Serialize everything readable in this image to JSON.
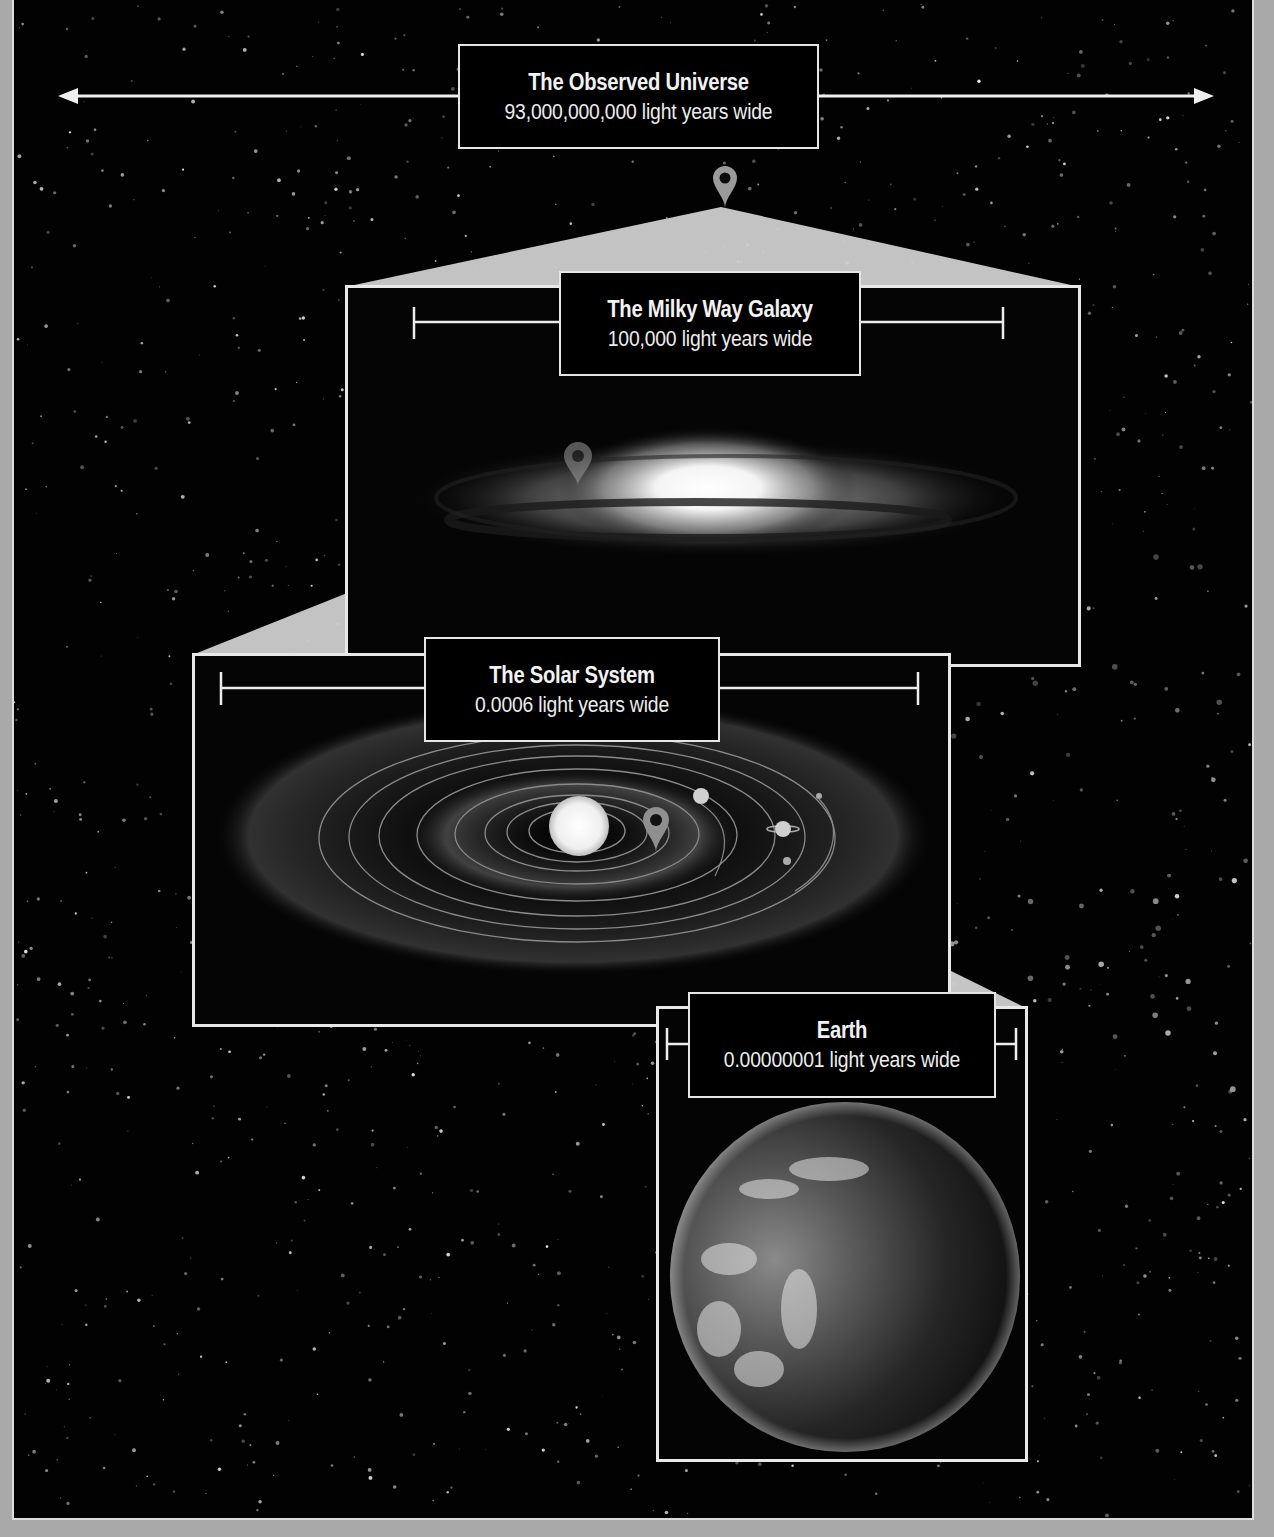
{
  "diagram": {
    "type": "scale-zoom-infographic",
    "theme": "grayscale",
    "colors": {
      "background": "#020202",
      "outer_frame": "#a9a9a9",
      "line": "#e8e8e8",
      "zoom_wedge": "#cfcfcf",
      "label_box_bg": "#000000",
      "label_text": "#f2f2f2",
      "pin": "#9a9a9a"
    },
    "levels": [
      {
        "id": "universe",
        "title": "The Observed Universe",
        "subtitle": "93,000,000,000 light years wide",
        "indicator": "double-arrow-span"
      },
      {
        "id": "galaxy",
        "title": "The Milky Way Galaxy",
        "subtitle": "100,000 light years wide",
        "indicator": "bracket-span",
        "image": "spiral-galaxy-edge-on"
      },
      {
        "id": "solar-system",
        "title": "The Solar System",
        "subtitle": "0.0006 light years wide",
        "indicator": "bracket-span",
        "image": "sun-with-orbits"
      },
      {
        "id": "earth",
        "title": "Earth",
        "subtitle": "0.00000001 light years wide",
        "indicator": "bracket-span",
        "image": "earth-globe"
      }
    ],
    "pins": [
      {
        "in": "universe",
        "points_to": "galaxy",
        "icon": "map-pin-icon"
      },
      {
        "in": "galaxy",
        "points_to": "solar-system",
        "icon": "map-pin-icon"
      },
      {
        "in": "solar-system",
        "points_to": "earth",
        "icon": "map-pin-icon"
      }
    ]
  }
}
